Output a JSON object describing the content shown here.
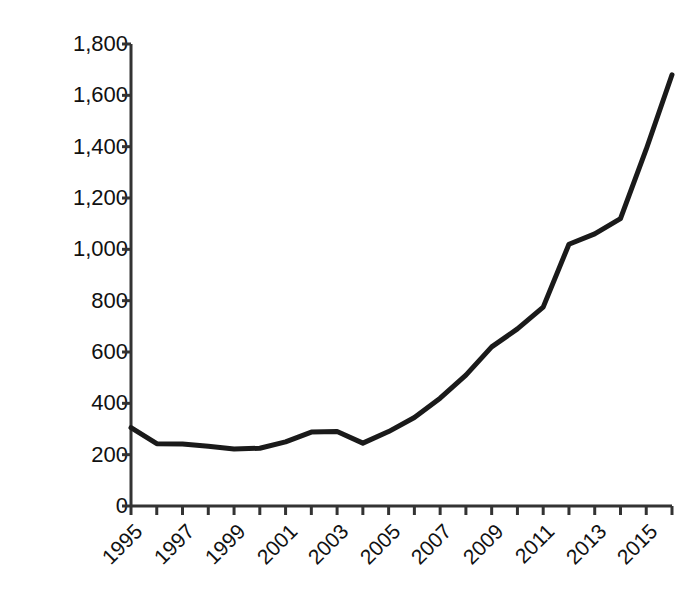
{
  "chart_data": {
    "type": "line",
    "title": "",
    "xlabel": "",
    "ylabel": "Number of awards",
    "x": [
      1995,
      1996,
      1997,
      1998,
      1999,
      2000,
      2001,
      2002,
      2003,
      2004,
      2005,
      2006,
      2007,
      2008,
      2009,
      2010,
      2011,
      2012,
      2013,
      2014,
      2015,
      2016
    ],
    "values": [
      305,
      243,
      242,
      233,
      222,
      225,
      250,
      288,
      290,
      245,
      290,
      345,
      420,
      510,
      620,
      690,
      775,
      1020,
      1060,
      1120,
      1390,
      1680
    ],
    "series": [
      {
        "name": "Number of awards",
        "values": [
          305,
          243,
          242,
          233,
          222,
          225,
          250,
          288,
          290,
          245,
          290,
          345,
          420,
          510,
          620,
          690,
          775,
          1020,
          1060,
          1120,
          1390,
          1680
        ]
      }
    ],
    "xlim": [
      1995,
      2016
    ],
    "ylim": [
      0,
      1800
    ],
    "ytick_values": [
      0,
      200,
      400,
      600,
      800,
      1000,
      1200,
      1400,
      1600,
      1800
    ],
    "ytick_labels": [
      "0",
      "200",
      "400",
      "600",
      "800",
      "1,000",
      "1,200",
      "1,400",
      "1,600",
      "1,800"
    ],
    "xtick_values": [
      1995,
      1997,
      1999,
      2001,
      2003,
      2005,
      2007,
      2009,
      2011,
      2013,
      2015
    ],
    "xtick_labels": [
      "1995",
      "1997",
      "1999",
      "2001",
      "2003",
      "2005",
      "2007",
      "2009",
      "2011",
      "2013",
      "2015"
    ],
    "xtick_rotation": -45,
    "grid": false,
    "legend": false,
    "line_color": "#1a1a1a",
    "line_width": 5,
    "axis_color": "#333333",
    "background_color": "#ffffff"
  }
}
